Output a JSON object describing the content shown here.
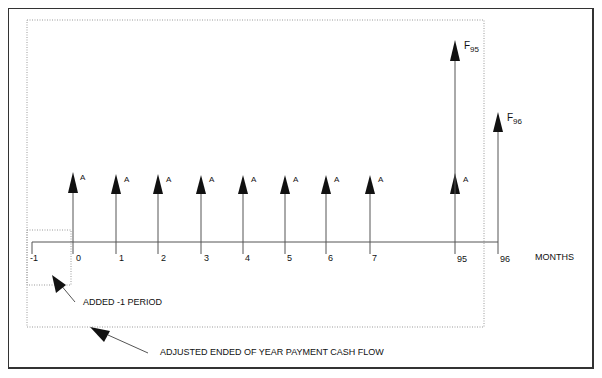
{
  "diagram": {
    "type": "cash-flow-diagram",
    "axis_label": "MONTHS",
    "periods": [
      {
        "label": "-1",
        "x": 32,
        "arrow": null
      },
      {
        "label": "0",
        "x": 73,
        "arrow": "A"
      },
      {
        "label": "1",
        "x": 116,
        "arrow": "A"
      },
      {
        "label": "2",
        "x": 158,
        "arrow": "A"
      },
      {
        "label": "3",
        "x": 201,
        "arrow": "A"
      },
      {
        "label": "4",
        "x": 243,
        "arrow": "A"
      },
      {
        "label": "5",
        "x": 285,
        "arrow": "A"
      },
      {
        "label": "6",
        "x": 326,
        "arrow": "A"
      },
      {
        "label": "7",
        "x": 370,
        "arrow": "A"
      },
      {
        "label": "95",
        "x": 455,
        "arrow": "A"
      },
      {
        "label": "96",
        "x": 498,
        "arrow": null
      }
    ],
    "payment_label": "A",
    "future_values": [
      {
        "label": "F",
        "subscript": "95",
        "period": "95"
      },
      {
        "label": "F",
        "subscript": "96",
        "period": "96"
      }
    ],
    "annotations": {
      "added_period": "ADDED -1 PERIOD",
      "adjusted_flow": "ADJUSTED ENDED OF YEAR PAYMENT CASH FLOW"
    },
    "colors": {
      "line": "#555555",
      "arrowhead": "#111111",
      "dotted": "#9a9a9a",
      "frame": "#333333"
    }
  }
}
